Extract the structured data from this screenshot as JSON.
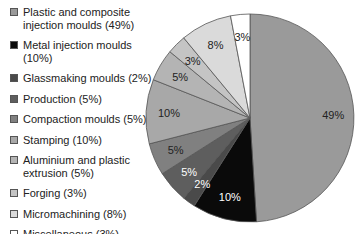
{
  "chart_data": {
    "type": "pie",
    "title": "",
    "start_angle": "12 o'clock, clockwise",
    "legend_position": "left",
    "categories": [
      "Plastic and composite injection moulds",
      "Metal injection moulds",
      "Glassmaking moulds",
      "Production",
      "Compaction moulds",
      "Stamping",
      "Aluminium and plastic extrusion",
      "Forging",
      "Micromachining",
      "Miscellaneous"
    ],
    "values": [
      49,
      10,
      2,
      5,
      5,
      10,
      5,
      3,
      8,
      3
    ],
    "slice_labels": [
      "49%",
      "10%",
      "2%",
      "5%",
      "5%",
      "10%",
      "5%",
      "3%",
      "8%",
      "3%"
    ],
    "colors": [
      "#9a9a9a",
      "#0a0a0a",
      "#4a4a4a",
      "#5e5e5e",
      "#808080",
      "#a8a8a8",
      "#b4b4b4",
      "#c4c4c4",
      "#dadada",
      "#ffffff"
    ],
    "label_colors": [
      "#222222",
      "#ffffff",
      "#ffffff",
      "#ffffff",
      "#222222",
      "#222222",
      "#222222",
      "#222222",
      "#222222",
      "#222222"
    ]
  },
  "legend": {
    "items": [
      {
        "label_line1": "Plastic and composite",
        "label_line2": "injection moulds (49%)"
      },
      {
        "label_line1": "Metal injection moulds (10%)",
        "label_line2": ""
      },
      {
        "label_line1": "Glassmaking moulds (2%)",
        "label_line2": ""
      },
      {
        "label_line1": "Production (5%)",
        "label_line2": ""
      },
      {
        "label_line1": "Compaction moulds (5%)",
        "label_line2": ""
      },
      {
        "label_line1": "Stamping (10%)",
        "label_line2": ""
      },
      {
        "label_line1": "Aluminium and plastic",
        "label_line2": "extrusion (5%)"
      },
      {
        "label_line1": "Forging (3%)",
        "label_line2": ""
      },
      {
        "label_line1": "Micromachining (8%)",
        "label_line2": ""
      },
      {
        "label_line1": "Miscellaneous (3%)",
        "label_line2": ""
      }
    ]
  }
}
